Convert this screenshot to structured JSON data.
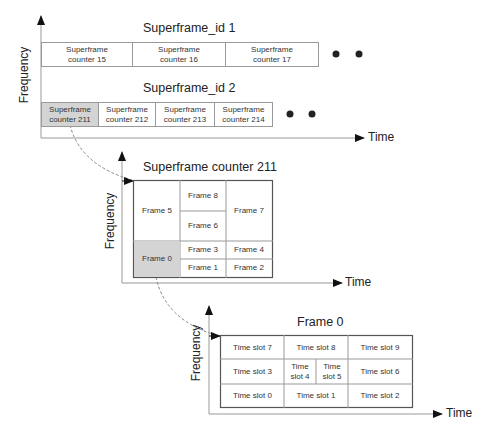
{
  "diagram": {
    "level1": {
      "y_axis_label": "Frequency",
      "x_axis_label": "Time",
      "rows": [
        {
          "title": "Superframe_id 1",
          "cells": [
            "Superframe counter 15",
            "Superframe counter 16",
            "Superframe counter 17"
          ],
          "continuation": "ellipsis-dots"
        },
        {
          "title": "Superframe_id 2",
          "cells": [
            "Superframe counter 211",
            "Superframe counter 212",
            "Superframe counter 213",
            "Superframe counter 214"
          ],
          "highlighted_cell": "Superframe counter 211",
          "continuation": "ellipsis-dots"
        }
      ],
      "cell_lines": {
        "r1c1": [
          "Superframe",
          "counter 15"
        ],
        "r1c2": [
          "Superframe",
          "counter 16"
        ],
        "r1c3": [
          "Superframe",
          "counter 17"
        ],
        "r2c1": [
          "Superframe",
          "counter 211"
        ],
        "r2c2": [
          "Superframe",
          "counter 212"
        ],
        "r2c3": [
          "Superframe",
          "counter 213"
        ],
        "r2c4": [
          "Superframe",
          "counter 214"
        ]
      }
    },
    "level2": {
      "title": "Superframe counter 211",
      "y_axis_label": "Frequency",
      "x_axis_label": "Time",
      "frames": {
        "f0": "Frame 0",
        "f1": "Frame 1",
        "f2": "Frame 2",
        "f3": "Frame 3",
        "f4": "Frame 4",
        "f5": "Frame 5",
        "f6": "Frame 6",
        "f7": "Frame 7",
        "f8": "Frame 8"
      },
      "highlighted_cell": "Frame 0"
    },
    "level3": {
      "title": "Frame 0",
      "y_axis_label": "Frequency",
      "x_axis_label": "Time",
      "slots": {
        "s0": "Time slot 0",
        "s1": "Time slot 1",
        "s2": "Time slot 2",
        "s3": "Time slot 3",
        "s4": [
          "Time",
          "slot 4"
        ],
        "s5": [
          "Time",
          "slot 5"
        ],
        "s6": "Time slot 6",
        "s7": "Time slot 7",
        "s8": "Time slot 8",
        "s9": "Time slot 9"
      }
    },
    "colors": {
      "highlight": "#d4d4d4",
      "line": "#888888",
      "axis": "#999999",
      "arrowhead": "#111111",
      "dot": "#222222"
    }
  }
}
